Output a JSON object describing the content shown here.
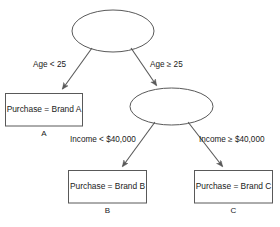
{
  "diagram": {
    "type": "decision-tree",
    "title": "",
    "nodes": {
      "root": {
        "shape": "ellipse",
        "label": "",
        "tag": ""
      },
      "internal_income": {
        "shape": "ellipse",
        "label": "",
        "tag": ""
      },
      "leaf_a": {
        "shape": "rectangle",
        "label": "Purchase = Brand A",
        "tag": "A"
      },
      "leaf_b": {
        "shape": "rectangle",
        "label": "Purchase = Brand B",
        "tag": "B"
      },
      "leaf_c": {
        "shape": "rectangle",
        "label": "Purchase = Brand C",
        "tag": "C"
      }
    },
    "edges": {
      "root_left": "Age < 25",
      "root_right": "Age ≥ 25",
      "income_left": "Income < $40,000",
      "income_right": "Income ≥ $40,000"
    },
    "colors": {
      "stroke": "#595959",
      "fill": "#ffffff",
      "text": "#1a1a1a",
      "background": "#ffffff"
    }
  }
}
